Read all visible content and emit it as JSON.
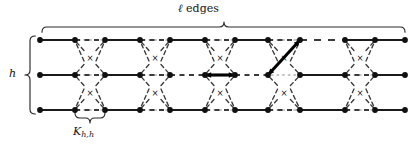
{
  "figure": {
    "type": "graph-diagram",
    "labels": {
      "top_brace": "ℓ edges",
      "left_brace": "h",
      "bottom_brace_base": "K",
      "bottom_brace_sub": "h,h"
    },
    "geometry": {
      "width": 416,
      "height": 150,
      "rows_y": [
        40,
        75,
        110
      ],
      "node_radius": 2.9,
      "node_color": "#101010",
      "solid_edge_color": "#1a1a1a",
      "dashed_edge_color": "#3a3a3a",
      "highlight_color": "#000000",
      "brace_color": "#2a2a2a"
    },
    "columns_x": [
      40,
      75,
      105,
      140,
      170,
      205,
      235,
      268,
      300,
      345,
      375,
      405
    ],
    "blocks": [
      {
        "name": "block-1",
        "left_x": 75,
        "right_x": 105,
        "cross_symbol": "×"
      },
      {
        "name": "block-2",
        "left_x": 140,
        "right_x": 170,
        "cross_symbol": "×"
      },
      {
        "name": "block-3",
        "left_x": 205,
        "right_x": 235,
        "cross_symbol": "×"
      },
      {
        "name": "block-4",
        "left_x": 268,
        "right_x": 300,
        "cross_symbol": "×"
      },
      {
        "name": "block-5",
        "left_x": 345,
        "right_x": 375,
        "cross_symbol": "×"
      }
    ],
    "solid_segments": [
      {
        "row": 0,
        "x1": 40,
        "x2": 75
      },
      {
        "row": 0,
        "x1": 105,
        "x2": 140
      },
      {
        "row": 0,
        "x1": 170,
        "x2": 205
      },
      {
        "row": 0,
        "x1": 235,
        "x2": 268
      },
      {
        "row": 0,
        "x1": 345,
        "x2": 375
      },
      {
        "row": 0,
        "x1": 375,
        "x2": 405
      },
      {
        "row": 1,
        "x1": 40,
        "x2": 75
      },
      {
        "row": 1,
        "x1": 105,
        "x2": 140
      },
      {
        "row": 1,
        "x1": 300,
        "x2": 345
      },
      {
        "row": 1,
        "x1": 375,
        "x2": 405
      },
      {
        "row": 2,
        "x1": 40,
        "x2": 75
      },
      {
        "row": 2,
        "x1": 105,
        "x2": 140
      },
      {
        "row": 2,
        "x1": 170,
        "x2": 205
      },
      {
        "row": 2,
        "x1": 235,
        "x2": 268
      },
      {
        "row": 2,
        "x1": 300,
        "x2": 345
      },
      {
        "row": 2,
        "x1": 375,
        "x2": 405
      }
    ],
    "dashed_segments": [
      {
        "row": 0,
        "x1": 75,
        "x2": 105
      },
      {
        "row": 0,
        "x1": 140,
        "x2": 170
      },
      {
        "row": 0,
        "x1": 205,
        "x2": 235
      },
      {
        "row": 0,
        "x1": 268,
        "x2": 300
      },
      {
        "row": 0,
        "x1": 300,
        "x2": 345
      },
      {
        "row": 1,
        "x1": 75,
        "x2": 105
      },
      {
        "row": 1,
        "x1": 140,
        "x2": 170
      },
      {
        "row": 1,
        "x1": 170,
        "x2": 205
      },
      {
        "row": 1,
        "x1": 235,
        "x2": 268
      },
      {
        "row": 1,
        "x1": 345,
        "x2": 375
      },
      {
        "row": 2,
        "x1": 75,
        "x2": 105
      },
      {
        "row": 2,
        "x1": 140,
        "x2": 170
      },
      {
        "row": 2,
        "x1": 205,
        "x2": 235
      },
      {
        "row": 2,
        "x1": 268,
        "x2": 300
      },
      {
        "row": 2,
        "x1": 345,
        "x2": 375
      }
    ],
    "highlight_edges": [
      {
        "name": "thick-horizontal-middle",
        "x1": 205,
        "y1": 75,
        "x2": 235,
        "y2": 75,
        "arrowheads": "both"
      },
      {
        "name": "thick-diagonal",
        "x1": 268,
        "y1": 75,
        "x2": 300,
        "y2": 40,
        "arrowheads": "both"
      }
    ],
    "braces": {
      "top": {
        "x1": 42,
        "x2": 405,
        "y": 27,
        "tip_x": 224,
        "direction": "down"
      },
      "left": {
        "y1": 36,
        "y2": 114,
        "x": 30,
        "tip_y": 75,
        "direction": "right"
      },
      "bottom": {
        "x1": 75,
        "x2": 105,
        "y": 118,
        "tip_x": 90,
        "direction": "up"
      }
    }
  }
}
